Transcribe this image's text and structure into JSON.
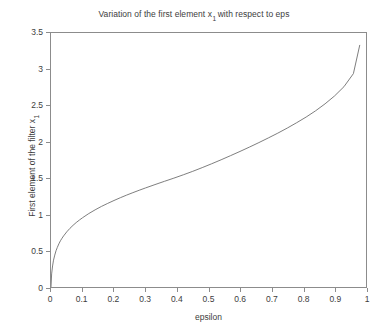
{
  "chart_data": {
    "type": "line",
    "title_prefix": "Variation of the first element x",
    "title_subscript": "1",
    "title_suffix": "with respect to eps",
    "xlabel": "epsilon",
    "ylabel_prefix": "First element of the filter x",
    "ylabel_subscript": "1",
    "ylabel": "First element of the filter x1",
    "xlim": [
      0,
      1
    ],
    "ylim": [
      0,
      3.5
    ],
    "xticks": [
      "0",
      "0.1",
      "0.2",
      "0.3",
      "0.4",
      "0.5",
      "0.6",
      "0.7",
      "0.8",
      "0.9",
      "1"
    ],
    "xtick_values": [
      0,
      0.1,
      0.2,
      0.3,
      0.4,
      0.5,
      0.6,
      0.7,
      0.8,
      0.9,
      1
    ],
    "yticks": [
      "0",
      "0.5",
      "1",
      "1.5",
      "2",
      "2.5",
      "3",
      "3.5"
    ],
    "ytick_values": [
      0,
      0.5,
      1,
      1.5,
      2,
      2.5,
      3,
      3.5
    ],
    "grid": false,
    "legend": null,
    "line_color": "#6e6e6e",
    "axis_color": "#8c8c8c",
    "background": "#ffffff",
    "series": [
      {
        "name": "x1 vs eps",
        "x": [
          0.0,
          0.002,
          0.005,
          0.008,
          0.012,
          0.016,
          0.02,
          0.025,
          0.03,
          0.035,
          0.04,
          0.05,
          0.06,
          0.07,
          0.08,
          0.09,
          0.1,
          0.12,
          0.14,
          0.16,
          0.18,
          0.2,
          0.22,
          0.24,
          0.26,
          0.28,
          0.3,
          0.33,
          0.36,
          0.39,
          0.42,
          0.45,
          0.48,
          0.51,
          0.54,
          0.57,
          0.6,
          0.63,
          0.66,
          0.69,
          0.72,
          0.75,
          0.78,
          0.81,
          0.84,
          0.87,
          0.9,
          0.93,
          0.96,
          0.98
        ],
        "y": [
          0.0,
          0.18,
          0.29,
          0.37,
          0.44,
          0.5,
          0.545,
          0.595,
          0.637,
          0.672,
          0.704,
          0.76,
          0.808,
          0.85,
          0.888,
          0.922,
          0.954,
          1.012,
          1.063,
          1.11,
          1.152,
          1.192,
          1.23,
          1.266,
          1.3,
          1.333,
          1.365,
          1.411,
          1.456,
          1.5,
          1.546,
          1.594,
          1.645,
          1.698,
          1.753,
          1.81,
          1.868,
          1.928,
          1.99,
          2.054,
          2.12,
          2.19,
          2.264,
          2.342,
          2.428,
          2.524,
          2.632,
          2.76,
          2.94,
          3.33
        ]
      }
    ]
  }
}
